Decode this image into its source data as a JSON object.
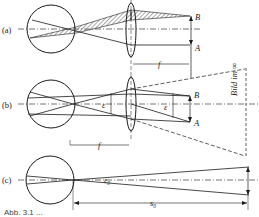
{
  "figure": {
    "panels": [
      {
        "id": "a",
        "label": "(a)"
      },
      {
        "id": "b",
        "label": "(b)"
      },
      {
        "id": "c",
        "label": "(c)"
      }
    ],
    "labels": {
      "point_B": "B",
      "point_A": "A",
      "focal_length": "f",
      "angle": "ε",
      "angle_c": "ε₀",
      "image_at_infinity": "Bild im ∞",
      "reference_distance": "s₀"
    },
    "caption_partial": "Abb. 3.1 ..."
  },
  "colors": {
    "line": "#1a1a1a",
    "hatch": "#555555",
    "background": "#ffffff"
  }
}
